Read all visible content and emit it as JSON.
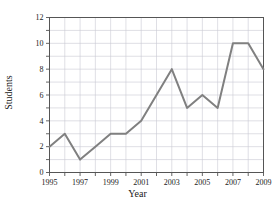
{
  "chart_data": {
    "type": "line",
    "title": "",
    "xlabel": "Year",
    "ylabel": "Students",
    "x": [
      1995,
      1996,
      1997,
      1998,
      1999,
      2000,
      2001,
      2002,
      2003,
      2004,
      2005,
      2006,
      2007,
      2008,
      2009
    ],
    "values": [
      2,
      3,
      1,
      2,
      3,
      3,
      4,
      6,
      8,
      5,
      6,
      5,
      10,
      10,
      8
    ],
    "series": [
      {
        "name": "Students",
        "values": [
          2,
          3,
          1,
          2,
          3,
          3,
          4,
          6,
          8,
          5,
          6,
          5,
          10,
          10,
          8
        ]
      }
    ],
    "xlim": [
      1995,
      2009
    ],
    "ylim": [
      0,
      12
    ],
    "x_tick_labels": [
      "1995",
      "1997",
      "1999",
      "2001",
      "2003",
      "2005",
      "2007",
      "2009"
    ],
    "x_tick_values": [
      1995,
      1997,
      1999,
      2001,
      2003,
      2005,
      2007,
      2009
    ],
    "x_minor_tick_values": [
      1996,
      1998,
      2000,
      2002,
      2004,
      2006,
      2008
    ],
    "y_tick_labels": [
      "0",
      "2",
      "4",
      "6",
      "8",
      "10",
      "12"
    ],
    "y_tick_values": [
      0,
      2,
      4,
      6,
      8,
      10,
      12
    ],
    "y_minor_tick_values": [
      1,
      3,
      5,
      7,
      9,
      11
    ],
    "grid": true,
    "grid_x_step": 1,
    "grid_y_step": 1,
    "legend": "none",
    "line_color": "#808080",
    "line_width": 2,
    "grid_color": "#c9c9d4",
    "axis_color": "#555555",
    "background_color": "#ffffff"
  }
}
